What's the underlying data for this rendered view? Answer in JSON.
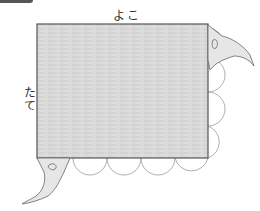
{
  "figure": {
    "labels": {
      "width_label": "よこ",
      "height_label": "たて"
    },
    "rectangle": {
      "x": 37,
      "y": 24,
      "width": 171,
      "height": 134,
      "fill": "#d8d8d8",
      "stroke": "#555555"
    },
    "scallops": {
      "right_edge_count": 3,
      "bottom_edge_count": 4,
      "stroke": "#9a9a9a"
    },
    "hands": [
      {
        "position": "top-right",
        "holding": "corner"
      },
      {
        "position": "bottom-left",
        "holding": "corner"
      }
    ],
    "colors": {
      "background": "#ffffff",
      "cloth": "#d8d8d8",
      "outline": "#555555",
      "hand_fill": "#e6e6e6"
    }
  }
}
